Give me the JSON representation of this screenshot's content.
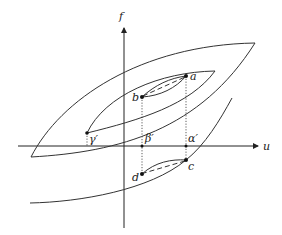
{
  "diagram": {
    "type": "hysteresis-loops",
    "axes": {
      "vertical_label": "f",
      "horizontal_label": "u"
    },
    "points": {
      "a": "a",
      "b": "b",
      "c": "c",
      "d": "d"
    },
    "axis_marks": {
      "gamma_prime": "γ′",
      "beta_prime": "β′",
      "alpha_prime": "α′"
    },
    "colors": {
      "line": "#333333",
      "background": "#ffffff"
    }
  }
}
